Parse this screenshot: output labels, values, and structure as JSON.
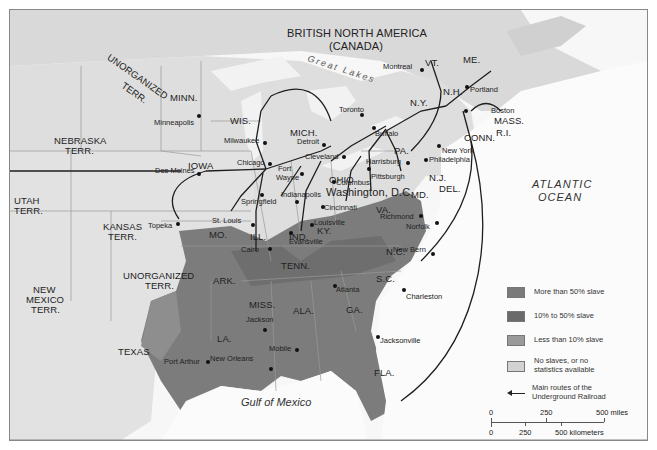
{
  "map": {
    "title_region": "BRITISH NORTH AMERICA",
    "title_region_sub": "(CANADA)",
    "water": {
      "great_lakes": "Great Lakes",
      "atlantic_1": "ATLANTIC",
      "atlantic_2": "OCEAN",
      "gulf": "Gulf of Mexico"
    },
    "territories": {
      "unorg_north_1": "UNORGANIZED",
      "unorg_north_2": "TERR.",
      "nebraska_1": "NEBRASKA",
      "nebraska_2": "TERR.",
      "utah_1": "UTAH",
      "utah_2": "TERR.",
      "kansas_1": "KANSAS",
      "kansas_2": "TERR.",
      "unorg_south_1": "UNORGANIZED",
      "unorg_south_2": "TERR.",
      "newmexico_1": "NEW",
      "newmexico_2": "MEXICO",
      "newmexico_3": "TERR."
    },
    "states": {
      "minn": "MINN.",
      "wis": "WIS.",
      "iowa": "IOWA",
      "mich": "MICH.",
      "ill": "ILL.",
      "ind": "IND.",
      "ohio": "OHIO",
      "pa": "PA.",
      "ny": "N.Y.",
      "vt": "VT.",
      "nh": "N.H.",
      "me": "ME.",
      "mass": "MASS.",
      "ri": "R.I.",
      "conn": "CONN.",
      "nj": "N.J.",
      "del": "DEL.",
      "md": "MD.",
      "va": "VA.",
      "ky": "KY.",
      "mo": "MO.",
      "tenn": "TENN.",
      "nc": "N.C.",
      "sc": "S.C.",
      "ga": "GA.",
      "ala": "ALA.",
      "miss": "MISS.",
      "ark": "ARK.",
      "la": "LA.",
      "texas": "TEXAS",
      "fla": "FLA."
    },
    "cities": {
      "minneapolis": "Minneapolis",
      "milwaukee": "Milwaukee",
      "des_moines": "Des Moines",
      "chicago": "Chicago",
      "detroit": "Detroit",
      "toronto": "Toronto",
      "buffalo": "Buffalo",
      "montreal": "Montreal",
      "portland": "Portland",
      "boston": "Boston",
      "new_york": "New York",
      "philadelphia": "Philadelphia",
      "harrisburg": "Harrisburg",
      "pittsburgh": "Pittsburgh",
      "cleveland": "Cleveland",
      "columbus": "Columbus",
      "washington": "Washington, D.C.",
      "fort_wayne_1": "Fort",
      "fort_wayne_2": "Wayne",
      "indianapolis": "Indianapolis",
      "springfield": "Springfield",
      "cincinnati": "Cincinnati",
      "st_louis": "St. Louis",
      "topeka": "Topeka",
      "cairo": "Cairo",
      "evansville": "Evansville",
      "louisville": "Louisville",
      "richmond": "Richmond",
      "norfolk": "Norfolk",
      "new_bern": "New Bern",
      "charleston": "Charleston",
      "atlanta": "Atlanta",
      "jackson": "Jackson",
      "mobile": "Mobile",
      "new_orleans": "New Orleans",
      "port_arthur": "Port Arthur",
      "jacksonville": "Jacksonville"
    }
  },
  "legend": {
    "items": [
      {
        "label": "More than 50% slave",
        "color": "#7a7a7a"
      },
      {
        "label": "10% to 50% slave",
        "color": "#6a6a6a"
      },
      {
        "label": "Less than 10% slave",
        "color": "#9a9a9a"
      },
      {
        "label": "No slaves, or no statistics available",
        "color": "#d2d2d2"
      }
    ],
    "route_label": "Main routes of the Underground Railroad"
  },
  "scale": {
    "miles": [
      "0",
      "250",
      "500 miles"
    ],
    "km": [
      "0",
      "250",
      "500 kilometers"
    ]
  }
}
